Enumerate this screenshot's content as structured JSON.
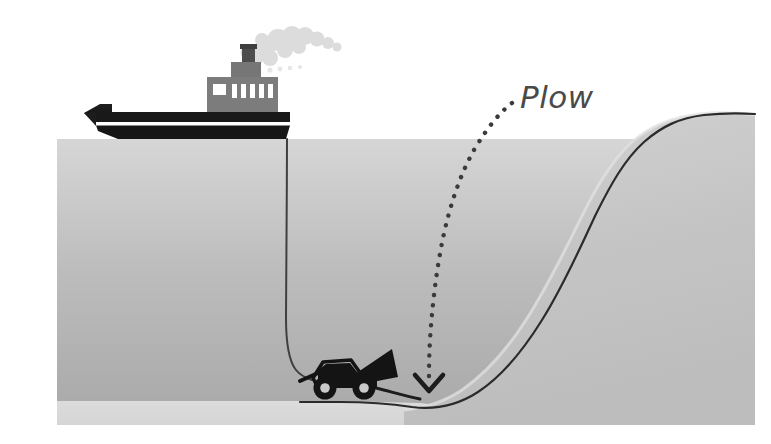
{
  "figure": {
    "background_color": "#ffffff",
    "width": 771,
    "height": 444
  },
  "annotations": [
    {
      "id": "plow-label",
      "text": "Plow",
      "color": "#4a4a4a",
      "x": 520,
      "y": 108,
      "leader": "dotted-curve",
      "arrow": "chevron-down"
    }
  ],
  "scene": {
    "water": {
      "name": "sea-water",
      "surface_y": 139,
      "left_x": 57,
      "right_x": 755,
      "bottom_y": 425,
      "color_top": "#d3d3d3",
      "color_bottom": "#a9a9a9"
    },
    "seabed": {
      "name": "seabed-floor",
      "color": "#d8d8d8",
      "top_y": 400,
      "bottom_y": 425
    },
    "slope": {
      "name": "continental-slope",
      "color_light": "#c9c9c9",
      "crest_y": 113,
      "toe_x": 430
    },
    "buried_cable": {
      "name": "buried-submarine-cable",
      "color": "#2b2b2b",
      "width": 2
    },
    "ship": {
      "name": "cable-laying-ship",
      "hull_color": "#1c1c1c",
      "stripe_color": "#ffffff",
      "superstructure_color": "#707070",
      "funnel_color": "#555555",
      "smoke_color": "#dcdcdc",
      "window_count": 6,
      "hull_left_x": 84,
      "hull_right_x": 290,
      "waterline_y": 139
    },
    "tow_cable": {
      "name": "tow-cable",
      "color": "#3a3a3a",
      "from_x": 287,
      "from_y": 139,
      "to_x": 305,
      "to_y": 377
    },
    "plow_vehicle": {
      "name": "seabed-plow",
      "body_color": "#141414",
      "wheel_color": "#141414",
      "hub_color": "#c9c9c9",
      "blade_color": "#141414",
      "x": 300,
      "y": 355
    }
  }
}
